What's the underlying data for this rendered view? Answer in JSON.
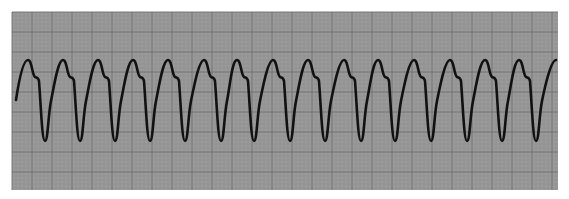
{
  "figure": {
    "colors": {
      "background": "#ffffff",
      "grid_paper": "#9a9a9a",
      "grid_minor": "#8a8a8a",
      "grid_major": "#6e6e6e",
      "trace": "#111111"
    },
    "strip": {
      "x": 12,
      "y": 12,
      "width": 546,
      "height": 178,
      "minor_spacing": 4,
      "major_every": 5
    },
    "trace": {
      "start": [
        16,
        100
      ],
      "peaks_x": [
        28,
        63,
        98,
        133,
        168,
        204,
        237,
        273,
        308,
        344,
        378,
        414,
        450,
        485,
        519,
        556
      ],
      "peak_y": 60,
      "shoulder_y": 77,
      "trough_y": 141,
      "stroke_width": 2.6
    }
  }
}
